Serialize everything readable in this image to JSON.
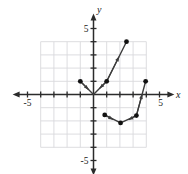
{
  "figure": {
    "kind": "cartesian-coordinate-plane",
    "background_color": "#ffffff",
    "grid_color": "#d9d9dd",
    "axis_color": "#2b2b2b",
    "curve_color": "#3c3c3c",
    "point_color": "#111111"
  },
  "axes": {
    "x_label": "x",
    "y_label": "y",
    "x_tick_labels": [
      {
        "text": "-5",
        "value": -5
      },
      {
        "text": "5",
        "value": 5
      }
    ],
    "y_tick_labels": [
      {
        "text": "5",
        "value": 5
      },
      {
        "text": "-5",
        "value": -5
      }
    ],
    "xlim": [
      -6.2,
      6.2
    ],
    "ylim": [
      -6.2,
      6.2
    ],
    "grid": true,
    "tick_step": 1
  },
  "chart_data": {
    "type": "line",
    "title": "",
    "xlabel": "x",
    "ylabel": "y",
    "xlim": [
      -6.2,
      6.2
    ],
    "ylim": [
      -6.2,
      6.2
    ],
    "grid": true,
    "legend": "none",
    "series": [
      {
        "name": "upper-branch",
        "type": "piecewise-linear",
        "points": [
          {
            "x": -1,
            "y": 1
          },
          {
            "x": 0,
            "y": 0
          },
          {
            "x": 1,
            "y": 1
          },
          {
            "x": 2.5,
            "y": 4
          }
        ],
        "endpoint_markers": [
          {
            "x": -1,
            "y": 1
          },
          {
            "x": 1,
            "y": 1
          },
          {
            "x": 2.5,
            "y": 4
          }
        ],
        "arrows": [
          {
            "from": {
              "x": -1,
              "y": 1
            },
            "to": {
              "x": 0,
              "y": 0
            }
          },
          {
            "from": {
              "x": 1,
              "y": 1
            },
            "to": {
              "x": 0.15,
              "y": 0.15
            }
          },
          {
            "from": {
              "x": 1,
              "y": 1
            },
            "to": {
              "x": 2.5,
              "y": 4
            }
          }
        ]
      },
      {
        "name": "lower-branch",
        "type": "piecewise-linear",
        "points": [
          {
            "x": 0.85,
            "y": -1.55
          },
          {
            "x": 2.05,
            "y": -2.15
          },
          {
            "x": 3.25,
            "y": -1.6
          },
          {
            "x": 3.95,
            "y": 1.0
          }
        ],
        "endpoint_markers": [
          {
            "x": 0.85,
            "y": -1.55
          },
          {
            "x": 2.05,
            "y": -2.15
          },
          {
            "x": 3.25,
            "y": -1.6
          },
          {
            "x": 3.95,
            "y": 1.0
          }
        ],
        "arrows": [
          {
            "from": {
              "x": 0.85,
              "y": -1.55
            },
            "to": {
              "x": 1.85,
              "y": -2.1
            }
          },
          {
            "from": {
              "x": 3.25,
              "y": -1.6
            },
            "to": {
              "x": 2.3,
              "y": -2.1
            }
          },
          {
            "from": {
              "x": 3.25,
              "y": -1.6
            },
            "to": {
              "x": 3.95,
              "y": 1.0
            }
          }
        ]
      }
    ]
  }
}
